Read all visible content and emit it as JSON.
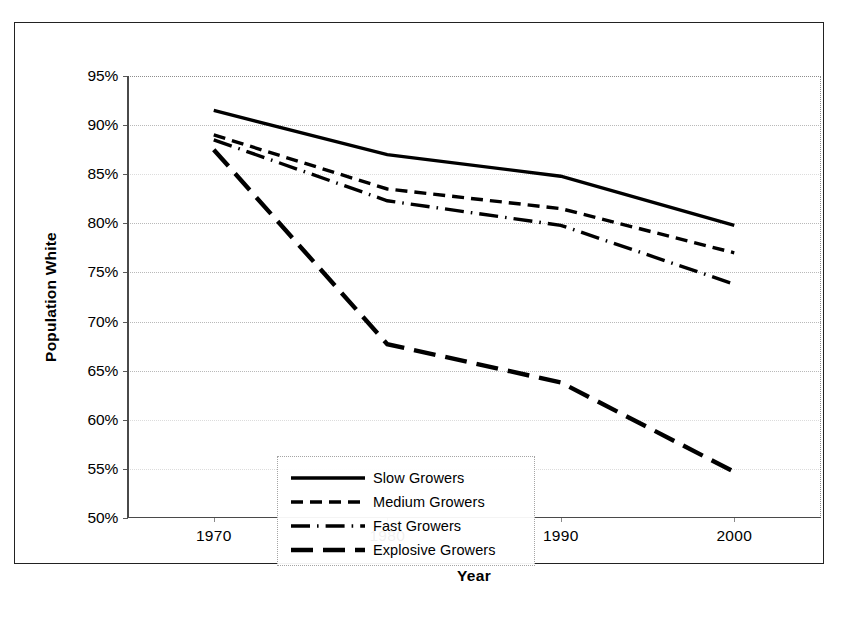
{
  "chart_data": {
    "type": "line",
    "title": "",
    "xlabel": "Year",
    "ylabel": "Population White",
    "x": [
      1970,
      1980,
      1990,
      2000
    ],
    "xtick_labels": [
      "1970",
      "1980",
      "1990",
      "2000"
    ],
    "ytick_labels": [
      "50%",
      "55%",
      "60%",
      "65%",
      "70%",
      "75%",
      "80%",
      "85%",
      "90%",
      "95%"
    ],
    "ytick_values": [
      50,
      55,
      60,
      65,
      70,
      75,
      80,
      85,
      90,
      95
    ],
    "ylim": [
      50,
      95
    ],
    "xlim": [
      1965,
      2005
    ],
    "y_unit": "%",
    "grid": "horizontal-dotted",
    "legend_position": "inside-lower-left",
    "series": [
      {
        "name": "Slow Growers",
        "style": "solid",
        "color": "#000000",
        "values": [
          91.5,
          87.0,
          84.8,
          79.8
        ]
      },
      {
        "name": "Medium Growers",
        "style": "dashed",
        "color": "#000000",
        "values": [
          89.0,
          83.5,
          81.5,
          77.0
        ]
      },
      {
        "name": "Fast Growers",
        "style": "dash-dot",
        "color": "#000000",
        "values": [
          88.5,
          82.3,
          79.8,
          73.8
        ]
      },
      {
        "name": "Explosive Growers",
        "style": "long-dash",
        "color": "#000000",
        "values": [
          87.5,
          67.7,
          63.8,
          54.7
        ]
      }
    ]
  },
  "legend": {
    "items": [
      {
        "label": "Slow Growers"
      },
      {
        "label": "Medium Growers"
      },
      {
        "label": "Fast Growers"
      },
      {
        "label": "Explosive Growers"
      }
    ]
  },
  "axes": {
    "x_title": "Year",
    "y_title": "Population White"
  }
}
